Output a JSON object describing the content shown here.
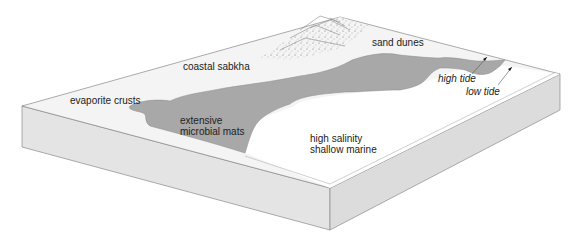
{
  "diagram": {
    "type": "block-diagram",
    "colors": {
      "top_surface": "#f4f4f4",
      "microbial_mats": "#a9a9a9",
      "marine": "#ffffff",
      "block_side": "#e2e2e2",
      "outline": "#777777"
    },
    "labels": {
      "coastal_sabkha": "coastal sabkha",
      "sand_dunes": "sand dunes",
      "evaporite_crusts": "evaporite crusts",
      "microbial_mats_line1": "extensive",
      "microbial_mats_line2": "microbial mats",
      "marine_line1": "high salinity",
      "marine_line2": "shallow marine",
      "high_tide": "high tide",
      "low_tide": "low tide"
    }
  }
}
